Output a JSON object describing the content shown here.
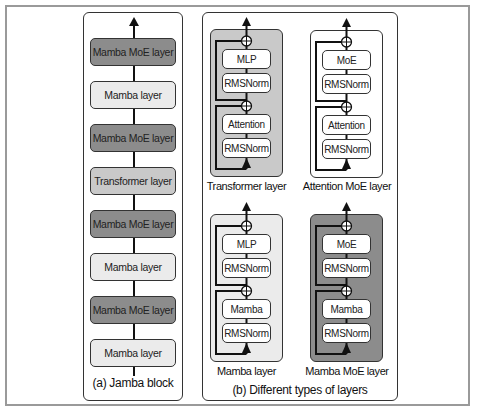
{
  "colors": {
    "moe": "#8c8c8c",
    "transformer": "#c9c9c9",
    "mamba": "#ebebeb",
    "attention_moe": "#ffffff",
    "line": "#111111"
  },
  "jamba_block": {
    "caption": "(a) Jamba block",
    "layers_top_to_bottom": [
      {
        "label": "Mamba MoE layer",
        "type": "moe"
      },
      {
        "label": "Mamba layer",
        "type": "mamba"
      },
      {
        "label": "Mamba MoE layer",
        "type": "moe"
      },
      {
        "label": "Transformer layer",
        "type": "transformer"
      },
      {
        "label": "Mamba MoE layer",
        "type": "moe"
      },
      {
        "label": "Mamba layer",
        "type": "mamba"
      },
      {
        "label": "Mamba MoE layer",
        "type": "moe"
      },
      {
        "label": "Mamba layer",
        "type": "mamba"
      }
    ]
  },
  "layer_types": {
    "caption": "(b) Different types of layers",
    "cards": [
      {
        "name": "Transformer layer",
        "type": "transformer",
        "sublayers_top_to_bottom": [
          "MLP",
          "RMSNorm",
          "Attention",
          "RMSNorm"
        ]
      },
      {
        "name": "Attention MoE layer",
        "type": "attention_moe",
        "sublayers_top_to_bottom": [
          "MoE",
          "RMSNorm",
          "Attention",
          "RMSNorm"
        ]
      },
      {
        "name": "Mamba layer",
        "type": "mamba",
        "sublayers_top_to_bottom": [
          "MLP",
          "RMSNorm",
          "Mamba",
          "RMSNorm"
        ]
      },
      {
        "name": "Mamba MoE layer",
        "type": "moe",
        "sublayers_top_to_bottom": [
          "MoE",
          "RMSNorm",
          "Mamba",
          "RMSNorm"
        ]
      }
    ]
  }
}
